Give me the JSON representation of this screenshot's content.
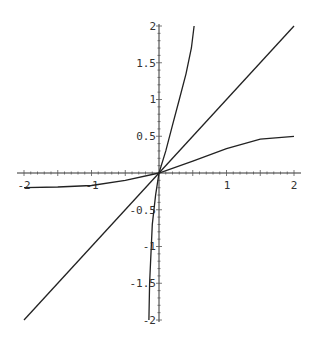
{
  "chart_data": {
    "type": "line",
    "title": "",
    "xlabel": "",
    "ylabel": "",
    "xlim": [
      -2,
      2
    ],
    "ylim": [
      -2,
      2
    ],
    "grid": false,
    "legend": null,
    "x_ticks": [
      "-2",
      "-1",
      "1",
      "2"
    ],
    "y_ticks": [
      "2",
      "1.5",
      "1",
      "0.5",
      "-0.5",
      "-1",
      "-1.5",
      "-2"
    ],
    "series": [
      {
        "name": "identity line",
        "x": [
          -2,
          -1,
          0,
          1,
          2
        ],
        "y": [
          -2,
          -1,
          0,
          1,
          2
        ]
      },
      {
        "name": "steep curve",
        "x": [
          -0.15,
          -0.14,
          -0.1,
          -0.05,
          0,
          0.1,
          0.2,
          0.3,
          0.4,
          0.48,
          0.52
        ],
        "y": [
          -2,
          -1.5,
          -0.7,
          -0.3,
          0,
          0.3,
          0.65,
          1.0,
          1.35,
          1.7,
          2
        ]
      },
      {
        "name": "saturating curve",
        "x": [
          -2,
          -1.5,
          -1,
          -0.5,
          0,
          0.5,
          1,
          1.5,
          2
        ],
        "y": [
          -0.2,
          -0.19,
          -0.17,
          -0.1,
          0,
          0.16,
          0.33,
          0.46,
          0.5
        ]
      }
    ]
  },
  "axes": {
    "x_labels": [
      {
        "text": "-2",
        "value": -2
      },
      {
        "text": "-1",
        "value": -1
      },
      {
        "text": "1",
        "value": 1
      },
      {
        "text": "2",
        "value": 2
      }
    ],
    "y_labels": [
      {
        "text": "2",
        "value": 2
      },
      {
        "text": "1.5",
        "value": 1.5
      },
      {
        "text": "1",
        "value": 1
      },
      {
        "text": "0.5",
        "value": 0.5
      },
      {
        "text": "-0.5",
        "value": -0.5
      },
      {
        "text": "-1",
        "value": -1
      },
      {
        "text": "-1.5",
        "value": -1.5
      },
      {
        "text": "-2",
        "value": -2
      }
    ]
  }
}
